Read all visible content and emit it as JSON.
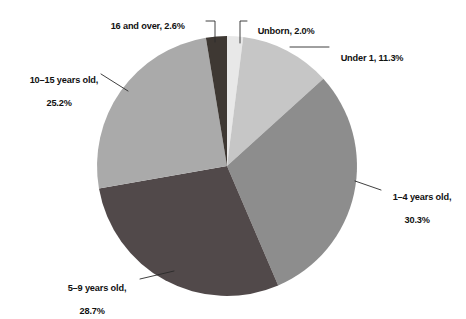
{
  "chart_data": {
    "type": "pie",
    "title": "",
    "subtitle": "",
    "xlabel": "",
    "ylabel": "",
    "legend_position": "none",
    "labels_position": "outside-with-leader-lines",
    "grid": false,
    "units": "percent",
    "total": 100.1,
    "categories": [
      "Unborn",
      "Under 1",
      "1–4 years old",
      "5–9 years old",
      "10–15 years old",
      "16 and over"
    ],
    "values": [
      2.0,
      11.3,
      30.3,
      28.7,
      25.2,
      2.6
    ],
    "slices": [
      {
        "name": "unborn",
        "category": "Unborn",
        "value": 2.0,
        "value_text": "2.0%",
        "label_text": "Unborn, 2.0%",
        "color": "#e8e8e8",
        "start_angle": 0.0,
        "end_angle": 7.2
      },
      {
        "name": "under-1",
        "category": "Under 1",
        "value": 11.3,
        "value_text": "11.3%",
        "label_text": "Under 1, 11.3%",
        "color": "#c6c6c6",
        "start_angle": 7.2,
        "end_angle": 47.88
      },
      {
        "name": "1-4-years-old",
        "category": "1–4 years old",
        "value": 30.3,
        "value_text": "30.3%",
        "label_line1": "1–4 years old,",
        "label_line2": "30.3%",
        "color": "#8d8d8d",
        "start_angle": 47.88,
        "end_angle": 156.96
      },
      {
        "name": "5-9-years-old",
        "category": "5–9 years old",
        "value": 28.7,
        "value_text": "28.7%",
        "label_line1": "5–9 years old,",
        "label_line2": "28.7%",
        "color": "#51494a",
        "start_angle": 156.96,
        "end_angle": 260.28
      },
      {
        "name": "10-15-years-old",
        "category": "10–15 years old",
        "value": 25.2,
        "value_text": "25.2%",
        "label_line1": "10–15 years old,",
        "label_line2": "25.2%",
        "color": "#aaaaaa",
        "start_angle": 260.28,
        "end_angle": 351.0
      },
      {
        "name": "16-and-over",
        "category": "16 and over",
        "value": 2.6,
        "value_text": "2.6%",
        "label_text": "16 and over, 2.6%",
        "color": "#3e3833",
        "start_angle": 351.0,
        "end_angle": 360.36
      }
    ]
  },
  "labels": {
    "sixteen_and_over": "16 and over, 2.6%",
    "unborn": "Unborn, 2.0%",
    "under_one": "Under 1, 11.3%",
    "one_to_four_line1": "1–4 years old,",
    "one_to_four_line2": "30.3%",
    "ten_to_fifteen_line1": "10–15 years old,",
    "ten_to_fifteen_line2": "25.2%",
    "five_to_nine_line1": "5–9 years old,",
    "five_to_nine_line2": "28.7%"
  },
  "style": {
    "background": "#ffffff",
    "leader_line_color": "#2a2a2a",
    "text_color": "#111111"
  }
}
